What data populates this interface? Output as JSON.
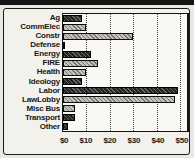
{
  "chart_data": {
    "type": "bar",
    "orientation": "horizontal",
    "title": "",
    "categories": [
      "Ag",
      "CommElec",
      "Constr",
      "Defense",
      "Energy",
      "FIRE",
      "Health",
      "Ideology",
      "Labor",
      "LawLobby",
      "Misc Bus",
      "Transport",
      "Other"
    ],
    "values": [
      8,
      10,
      30,
      1,
      12,
      15,
      10,
      8,
      49,
      48,
      5,
      5,
      2
    ],
    "bar_patterns": [
      "dark",
      "light",
      "light",
      "dark",
      "dark",
      "light",
      "light",
      "dark",
      "dark",
      "light",
      "light",
      "dark",
      "dark"
    ],
    "x_tick_labels": [
      "$0",
      "$10",
      "$20",
      "$30",
      "$40",
      "$50"
    ],
    "x_tick_values": [
      0,
      10,
      20,
      30,
      40,
      50
    ],
    "xlim": [
      0,
      53
    ],
    "grid": "vertical dotted gridlines at each $10",
    "legend": "none",
    "colors": {
      "bar_dark": "#242424",
      "bar_light": "#c6c3bc",
      "frame": "#1a1a1a",
      "plot_background": "#faf8f4",
      "page_background": "#f3f1ec",
      "top_band": "#151515"
    }
  }
}
